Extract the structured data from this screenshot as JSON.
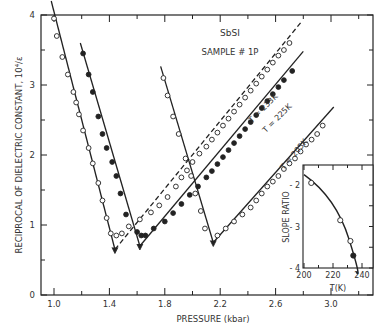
{
  "chart_data": [
    {
      "type": "line",
      "title": "SbSI",
      "subtitle": "SAMPLE # 1P",
      "xlabel": "PRESSURE (kbar)",
      "ylabel": "RECIPROCAL OF DIELECTRIC CONSTANT, 10^4/ε",
      "xlim": [
        0.91,
        3.31
      ],
      "ylim": [
        0,
        4
      ],
      "x_ticks": [
        "1.0",
        "1.4",
        "1.8",
        "2.2",
        "2.6",
        "3.0"
      ],
      "y_ticks": [
        "0",
        "1",
        "2",
        "3",
        "4"
      ],
      "grid": false,
      "series": [
        {
          "name": "T = 233K",
          "marker": "open-circle",
          "descending": {
            "x": [
              1.0,
              1.02,
              1.06,
              1.1,
              1.14,
              1.16,
              1.18,
              1.21,
              1.25,
              1.28,
              1.32,
              1.35,
              1.38,
              1.41
            ],
            "y": [
              3.95,
              3.7,
              3.4,
              3.15,
              2.9,
              2.75,
              2.58,
              2.35,
              2.1,
              1.88,
              1.6,
              1.35,
              1.1,
              0.88
            ]
          },
          "minimum": {
            "x": 1.44,
            "y": 0.65
          },
          "anomalous_points": {
            "x": [
              1.45,
              1.49,
              1.54
            ],
            "y": [
              0.85,
              0.88,
              0.98
            ]
          },
          "ascending": {
            "x": [
              1.62,
              1.7,
              1.76,
              1.82,
              1.88,
              1.92,
              1.96,
              2.0,
              2.05,
              2.1,
              2.14,
              2.18,
              2.22,
              2.26,
              2.3,
              2.34,
              2.38,
              2.42,
              2.46,
              2.5,
              2.54,
              2.58,
              2.62,
              2.66,
              2.7
            ],
            "y": [
              1.08,
              1.18,
              1.28,
              1.4,
              1.55,
              1.68,
              1.78,
              1.9,
              2.02,
              2.12,
              2.22,
              2.32,
              2.42,
              2.52,
              2.62,
              2.72,
              2.82,
              2.92,
              3.02,
              3.12,
              3.22,
              3.32,
              3.42,
              3.5,
              3.6
            ]
          }
        },
        {
          "name": "T = 225K",
          "marker": "filled-circle",
          "descending": {
            "x": [
              1.21,
              1.25,
              1.28,
              1.32,
              1.35,
              1.38,
              1.42,
              1.45,
              1.48,
              1.52
            ],
            "y": [
              3.45,
              3.15,
              2.9,
              2.55,
              2.3,
              2.1,
              1.9,
              1.7,
              1.45,
              1.15
            ]
          },
          "minimum": {
            "x": 1.62,
            "y": 0.7
          },
          "anomalous_points": {
            "x": [
              1.6,
              1.63,
              1.66
            ],
            "y": [
              0.9,
              0.85,
              0.85
            ]
          },
          "ascending": {
            "x": [
              1.72,
              1.8,
              1.86,
              1.92,
              1.98,
              2.04,
              2.1,
              2.14,
              2.18,
              2.22,
              2.26,
              2.3,
              2.34,
              2.38,
              2.42,
              2.46,
              2.5,
              2.54,
              2.58,
              2.62,
              2.66,
              2.72
            ],
            "y": [
              0.95,
              1.05,
              1.17,
              1.3,
              1.43,
              1.55,
              1.68,
              1.77,
              1.87,
              1.97,
              2.07,
              2.17,
              2.27,
              2.37,
              2.47,
              2.57,
              2.67,
              2.77,
              2.87,
              2.97,
              3.07,
              3.2
            ]
          }
        },
        {
          "name": "T = 205K",
          "marker": "open-circle",
          "descending": {
            "x": [
              1.79,
              1.82,
              1.86,
              1.9,
              1.95,
              1.99,
              2.02,
              2.06,
              2.09
            ],
            "y": [
              3.1,
              2.85,
              2.55,
              2.3,
              1.95,
              1.7,
              1.45,
              1.2,
              0.95
            ]
          },
          "minimum": {
            "x": 2.15,
            "y": 0.75
          },
          "ascending": {
            "x": [
              2.18,
              2.24,
              2.3,
              2.36,
              2.42,
              2.46,
              2.5,
              2.54,
              2.58,
              2.62,
              2.66,
              2.7,
              2.74,
              2.78,
              2.82,
              2.86,
              2.9,
              2.94
            ],
            "y": [
              0.85,
              0.95,
              1.05,
              1.15,
              1.25,
              1.35,
              1.45,
              1.55,
              1.62,
              1.7,
              1.8,
              1.88,
              1.95,
              2.05,
              2.15,
              2.22,
              2.3,
              2.42
            ]
          }
        }
      ],
      "annotations": [
        "SbSI",
        "SAMPLE # 1P",
        "T = 233K",
        "T = 225K",
        "T = 205K"
      ]
    },
    {
      "type": "line",
      "title": "inset",
      "xlabel": "T(K)",
      "ylabel": "SLOPE RATIO",
      "xlim": [
        200,
        248
      ],
      "ylim": [
        -4,
        -1.5
      ],
      "x_ticks": [
        "200",
        "220",
        "240"
      ],
      "y_ticks": [
        "-2",
        "-3",
        "-4"
      ],
      "series": [
        {
          "name": "open points",
          "x": [
            205,
            225,
            232
          ],
          "y": [
            -1.95,
            -2.85,
            -3.35
          ]
        },
        {
          "name": "filled point",
          "x": [
            234
          ],
          "y": [
            -3.7
          ]
        }
      ]
    }
  ],
  "labels": {
    "title": "SbSI",
    "sample": "SAMPLE # 1P",
    "xlabel": "PRESSURE (kbar)",
    "ylabel": "RECIPROCAL OF DIELECTRIC CONSTANT, 10⁴/ε",
    "curve_233": "T = 233K",
    "curve_225": "T = 225K",
    "curve_205": "T = 205K",
    "inset_xlabel": "T(K)",
    "inset_ylabel": "SLOPE RATIO",
    "x_ticks": [
      "1.0",
      "1.4",
      "1.8",
      "2.2",
      "2.6",
      "3.0"
    ],
    "y_ticks": [
      "0",
      "1",
      "2",
      "3",
      "4"
    ],
    "inset_x_ticks": [
      "200",
      "220",
      "240"
    ],
    "inset_y_ticks": [
      "- 2",
      "- 3",
      "- 4"
    ]
  }
}
